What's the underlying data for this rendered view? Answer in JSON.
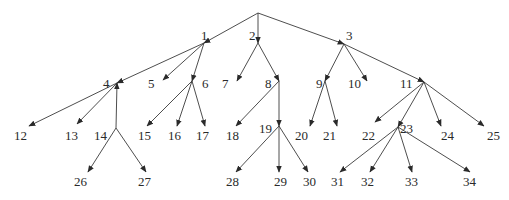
{
  "diagram": {
    "type": "tree",
    "root": {
      "id": "root",
      "x": 258,
      "y": 13
    },
    "nodes": [
      {
        "id": "1",
        "label": "1",
        "lx": 201,
        "ly": 40,
        "px": 204,
        "py": 43
      },
      {
        "id": "2",
        "label": "2",
        "lx": 249,
        "ly": 40,
        "px": 258,
        "py": 43
      },
      {
        "id": "3",
        "label": "3",
        "lx": 346,
        "ly": 40,
        "px": 344,
        "py": 44
      },
      {
        "id": "4",
        "label": "4",
        "lx": 103,
        "ly": 88,
        "px": 117,
        "py": 83
      },
      {
        "id": "5",
        "label": "5",
        "lx": 148,
        "ly": 88,
        "px": 163,
        "py": 80
      },
      {
        "id": "6",
        "label": "6",
        "lx": 202,
        "ly": 88,
        "px": 192,
        "py": 81
      },
      {
        "id": "7",
        "label": "7",
        "lx": 222,
        "ly": 88,
        "px": 237,
        "py": 81
      },
      {
        "id": "8",
        "label": "8",
        "lx": 265,
        "ly": 88,
        "px": 279,
        "py": 81
      },
      {
        "id": "9",
        "label": "9",
        "lx": 316,
        "ly": 88,
        "px": 325,
        "py": 81
      },
      {
        "id": "10",
        "label": "10",
        "lx": 348,
        "ly": 88,
        "px": 367,
        "py": 81
      },
      {
        "id": "11",
        "label": "11",
        "lx": 400,
        "ly": 88,
        "px": 424,
        "py": 82
      },
      {
        "id": "12",
        "label": "12",
        "lx": 14,
        "ly": 140,
        "px": 29,
        "py": 126
      },
      {
        "id": "13",
        "label": "13",
        "lx": 65,
        "ly": 140,
        "px": 77,
        "py": 124
      },
      {
        "id": "14",
        "label": "14",
        "lx": 94,
        "ly": 140,
        "px": 116,
        "py": 128
      },
      {
        "id": "15",
        "label": "15",
        "lx": 138,
        "ly": 140,
        "px": 147,
        "py": 126
      },
      {
        "id": "16",
        "label": "16",
        "lx": 168,
        "ly": 140,
        "px": 177,
        "py": 126
      },
      {
        "id": "17",
        "label": "17",
        "lx": 196,
        "ly": 140,
        "px": 205,
        "py": 126
      },
      {
        "id": "18",
        "label": "18",
        "lx": 226,
        "ly": 140,
        "px": 236,
        "py": 126
      },
      {
        "id": "19",
        "label": "19",
        "lx": 259,
        "ly": 133,
        "px": 279,
        "py": 126
      },
      {
        "id": "20",
        "label": "20",
        "lx": 295,
        "ly": 140,
        "px": 310,
        "py": 126
      },
      {
        "id": "21",
        "label": "21",
        "lx": 323,
        "ly": 140,
        "px": 337,
        "py": 126
      },
      {
        "id": "22",
        "label": "22",
        "lx": 362,
        "ly": 140,
        "px": 375,
        "py": 122
      },
      {
        "id": "23",
        "label": "23",
        "lx": 400,
        "ly": 133,
        "px": 398,
        "py": 127
      },
      {
        "id": "24",
        "label": "24",
        "lx": 441,
        "ly": 140,
        "px": 441,
        "py": 126
      },
      {
        "id": "25",
        "label": "25",
        "lx": 487,
        "ly": 140,
        "px": 484,
        "py": 126
      },
      {
        "id": "26",
        "label": "26",
        "lx": 74,
        "ly": 186,
        "px": 88,
        "py": 172
      },
      {
        "id": "27",
        "label": "27",
        "lx": 138,
        "ly": 186,
        "px": 146,
        "py": 172
      },
      {
        "id": "28",
        "label": "28",
        "lx": 226,
        "ly": 186,
        "px": 236,
        "py": 172
      },
      {
        "id": "29",
        "label": "29",
        "lx": 274,
        "ly": 186,
        "px": 279,
        "py": 172
      },
      {
        "id": "30",
        "label": "30",
        "lx": 303,
        "ly": 186,
        "px": 308,
        "py": 172
      },
      {
        "id": "31",
        "label": "31",
        "lx": 331,
        "ly": 186,
        "px": 340,
        "py": 172
      },
      {
        "id": "32",
        "label": "32",
        "lx": 361,
        "ly": 186,
        "px": 370,
        "py": 172
      },
      {
        "id": "33",
        "label": "33",
        "lx": 405,
        "ly": 186,
        "px": 412,
        "py": 172
      },
      {
        "id": "34",
        "label": "34",
        "lx": 463,
        "ly": 186,
        "px": 470,
        "py": 172
      }
    ],
    "edges": [
      {
        "from": "root",
        "to": "1"
      },
      {
        "from": "root",
        "to": "2"
      },
      {
        "from": "root",
        "to": "3"
      },
      {
        "from": "1",
        "to": "4"
      },
      {
        "from": "1",
        "to": "5"
      },
      {
        "from": "1",
        "to": "6"
      },
      {
        "from": "2",
        "to": "7"
      },
      {
        "from": "2",
        "to": "8"
      },
      {
        "from": "3",
        "to": "9"
      },
      {
        "from": "3",
        "to": "10"
      },
      {
        "from": "3",
        "to": "11"
      },
      {
        "from": "4",
        "to": "12"
      },
      {
        "from": "4",
        "to": "13"
      },
      {
        "from": "14",
        "to": "4",
        "note": "arrow points upward into 4"
      },
      {
        "from": "6",
        "to": "15"
      },
      {
        "from": "6",
        "to": "16"
      },
      {
        "from": "6",
        "to": "17"
      },
      {
        "from": "8",
        "to": "18"
      },
      {
        "from": "8",
        "to": "19"
      },
      {
        "from": "9",
        "to": "20"
      },
      {
        "from": "9",
        "to": "21"
      },
      {
        "from": "11",
        "to": "22"
      },
      {
        "from": "11",
        "to": "23"
      },
      {
        "from": "11",
        "to": "24"
      },
      {
        "from": "11",
        "to": "25"
      },
      {
        "from": "14",
        "to": "26"
      },
      {
        "from": "14",
        "to": "27"
      },
      {
        "from": "19",
        "to": "28"
      },
      {
        "from": "19",
        "to": "29"
      },
      {
        "from": "19",
        "to": "30"
      },
      {
        "from": "23",
        "to": "31"
      },
      {
        "from": "23",
        "to": "32"
      },
      {
        "from": "23",
        "to": "33"
      },
      {
        "from": "23",
        "to": "34"
      }
    ]
  }
}
